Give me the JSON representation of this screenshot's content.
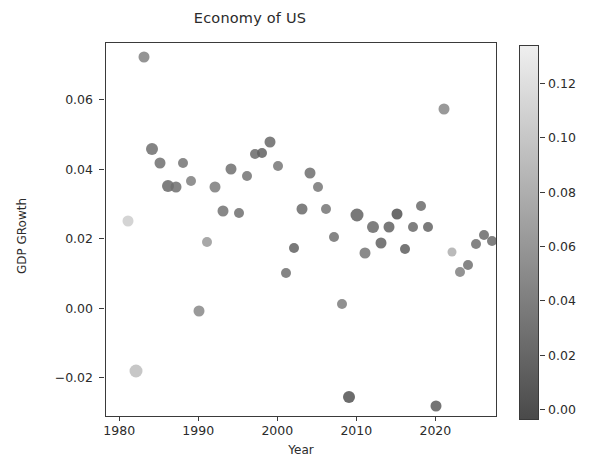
{
  "chart_data": {
    "type": "scatter",
    "title": "Economy of US",
    "xlabel": "Year",
    "ylabel": "GDP GRowth",
    "xlim": [
      1978.2,
      2027.8
    ],
    "ylim": [
      -0.0315,
      0.0765
    ],
    "grid": false,
    "xticks": [
      1980,
      1990,
      2000,
      2010,
      2020
    ],
    "xticklabels": [
      "1980",
      "1990",
      "2000",
      "2010",
      "2020"
    ],
    "yticks": [
      -0.02,
      0.0,
      0.02,
      0.04,
      0.06
    ],
    "yticklabels": [
      "−0.02",
      "0.00",
      "0.02",
      "0.04",
      "0.06"
    ],
    "colorbar": {
      "label": "",
      "cmap": "gray-light-high",
      "vmin": -0.004,
      "vmax": 0.134,
      "ticks": [
        0.0,
        0.02,
        0.04,
        0.06,
        0.08,
        0.1,
        0.12
      ],
      "ticklabels": [
        "0.00",
        "0.02",
        "0.04",
        "0.06",
        "0.08",
        "0.10",
        "0.12"
      ]
    },
    "encoding": {
      "x": "Year",
      "y": "GDP Growth",
      "color": "third variable (0.00 - 0.13 scale, light = high)",
      "size": "fourth variable (marker area varies)"
    },
    "points": [
      {
        "x": 1981,
        "y": 0.0253,
        "c": 0.105,
        "s": 11
      },
      {
        "x": 1982,
        "y": -0.0179,
        "c": 0.092,
        "s": 13
      },
      {
        "x": 1983,
        "y": 0.0724,
        "c": 0.042,
        "s": 11
      },
      {
        "x": 1984,
        "y": 0.0459,
        "c": 0.026,
        "s": 12
      },
      {
        "x": 1985,
        "y": 0.0419,
        "c": 0.028,
        "s": 11
      },
      {
        "x": 1986,
        "y": 0.0352,
        "c": 0.022,
        "s": 12
      },
      {
        "x": 1987,
        "y": 0.035,
        "c": 0.026,
        "s": 11
      },
      {
        "x": 1988,
        "y": 0.0418,
        "c": 0.031,
        "s": 10
      },
      {
        "x": 1989,
        "y": 0.0369,
        "c": 0.04,
        "s": 10
      },
      {
        "x": 1990,
        "y": -0.0008,
        "c": 0.048,
        "s": 11
      },
      {
        "x": 1991,
        "y": 0.0193,
        "c": 0.062,
        "s": 10
      },
      {
        "x": 1992,
        "y": 0.035,
        "c": 0.037,
        "s": 11
      },
      {
        "x": 1993,
        "y": 0.0282,
        "c": 0.03,
        "s": 11
      },
      {
        "x": 1994,
        "y": 0.0403,
        "c": 0.028,
        "s": 11
      },
      {
        "x": 1995,
        "y": 0.0274,
        "c": 0.028,
        "s": 10
      },
      {
        "x": 1996,
        "y": 0.0381,
        "c": 0.03,
        "s": 10
      },
      {
        "x": 1997,
        "y": 0.0444,
        "c": 0.023,
        "s": 10
      },
      {
        "x": 1998,
        "y": 0.0449,
        "c": 0.016,
        "s": 10
      },
      {
        "x": 1999,
        "y": 0.048,
        "c": 0.022,
        "s": 11
      },
      {
        "x": 2000,
        "y": 0.0412,
        "c": 0.034,
        "s": 10
      },
      {
        "x": 2001,
        "y": 0.0103,
        "c": 0.028,
        "s": 10
      },
      {
        "x": 2002,
        "y": 0.0174,
        "c": 0.016,
        "s": 10
      },
      {
        "x": 2003,
        "y": 0.0286,
        "c": 0.023,
        "s": 11
      },
      {
        "x": 2004,
        "y": 0.039,
        "c": 0.027,
        "s": 11
      },
      {
        "x": 2005,
        "y": 0.0351,
        "c": 0.034,
        "s": 10
      },
      {
        "x": 2006,
        "y": 0.0286,
        "c": 0.032,
        "s": 10
      },
      {
        "x": 2007,
        "y": 0.0205,
        "c": 0.029,
        "s": 10
      },
      {
        "x": 2008,
        "y": 0.0013,
        "c": 0.038,
        "s": 10
      },
      {
        "x": 2009,
        "y": -0.0255,
        "c": 0.003,
        "s": 12
      },
      {
        "x": 2010,
        "y": 0.0271,
        "c": 0.016,
        "s": 13
      },
      {
        "x": 2011,
        "y": 0.0159,
        "c": 0.032,
        "s": 11
      },
      {
        "x": 2012,
        "y": 0.0234,
        "c": 0.021,
        "s": 12
      },
      {
        "x": 2013,
        "y": 0.0188,
        "c": 0.015,
        "s": 11
      },
      {
        "x": 2014,
        "y": 0.0235,
        "c": 0.016,
        "s": 11
      },
      {
        "x": 2015,
        "y": 0.0273,
        "c": 0.002,
        "s": 11
      },
      {
        "x": 2016,
        "y": 0.0172,
        "c": 0.013,
        "s": 10
      },
      {
        "x": 2017,
        "y": 0.0235,
        "c": 0.021,
        "s": 10
      },
      {
        "x": 2018,
        "y": 0.0296,
        "c": 0.024,
        "s": 10
      },
      {
        "x": 2019,
        "y": 0.0234,
        "c": 0.018,
        "s": 10
      },
      {
        "x": 2020,
        "y": -0.0281,
        "c": 0.012,
        "s": 11
      },
      {
        "x": 2021,
        "y": 0.0574,
        "c": 0.047,
        "s": 11
      },
      {
        "x": 2022,
        "y": 0.0163,
        "c": 0.08,
        "s": 9
      },
      {
        "x": 2023,
        "y": 0.0106,
        "c": 0.041,
        "s": 10
      },
      {
        "x": 2024,
        "y": 0.0126,
        "c": 0.029,
        "s": 10
      },
      {
        "x": 2025,
        "y": 0.0186,
        "c": 0.026,
        "s": 10
      },
      {
        "x": 2026,
        "y": 0.0213,
        "c": 0.023,
        "s": 10
      },
      {
        "x": 2027,
        "y": 0.0196,
        "c": 0.023,
        "s": 10
      }
    ]
  }
}
